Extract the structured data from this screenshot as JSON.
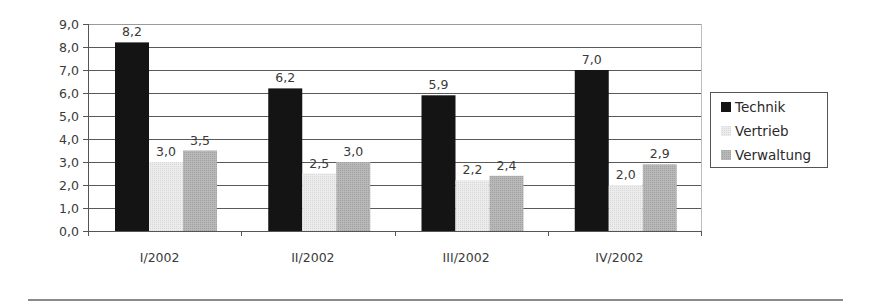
{
  "chart_data": {
    "type": "bar",
    "title": "",
    "xlabel": "",
    "ylabel": "",
    "ylim": [
      0,
      9
    ],
    "yticks": [
      "0,0",
      "1,0",
      "2,0",
      "3,0",
      "4,0",
      "5,0",
      "6,0",
      "7,0",
      "8,0",
      "9,0"
    ],
    "grid": true,
    "legend_position": "right",
    "categories": [
      "I/2002",
      "II/2002",
      "III/2002",
      "IV/2002"
    ],
    "series": [
      {
        "name": "Technik",
        "color": "#141414",
        "values": [
          8.2,
          6.2,
          5.9,
          7.0
        ],
        "labels": [
          "8,2",
          "6,2",
          "5,9",
          "7,0"
        ]
      },
      {
        "name": "Vertrieb",
        "color": "#e6e6e6",
        "values": [
          3.0,
          2.5,
          2.2,
          2.0
        ],
        "labels": [
          "3,0",
          "2,5",
          "2,2",
          "2,0"
        ]
      },
      {
        "name": "Verwaltung",
        "color": "#b2b2b2",
        "values": [
          3.5,
          3.0,
          2.4,
          2.9
        ],
        "labels": [
          "3,5",
          "3,0",
          "2,4",
          "2,9"
        ]
      }
    ]
  },
  "legend": {
    "items": [
      {
        "label": "Technik",
        "color": "#141414"
      },
      {
        "label": "Vertrieb",
        "color": "#e6e6e6"
      },
      {
        "label": "Verwaltung",
        "color": "#b2b2b2"
      }
    ]
  }
}
